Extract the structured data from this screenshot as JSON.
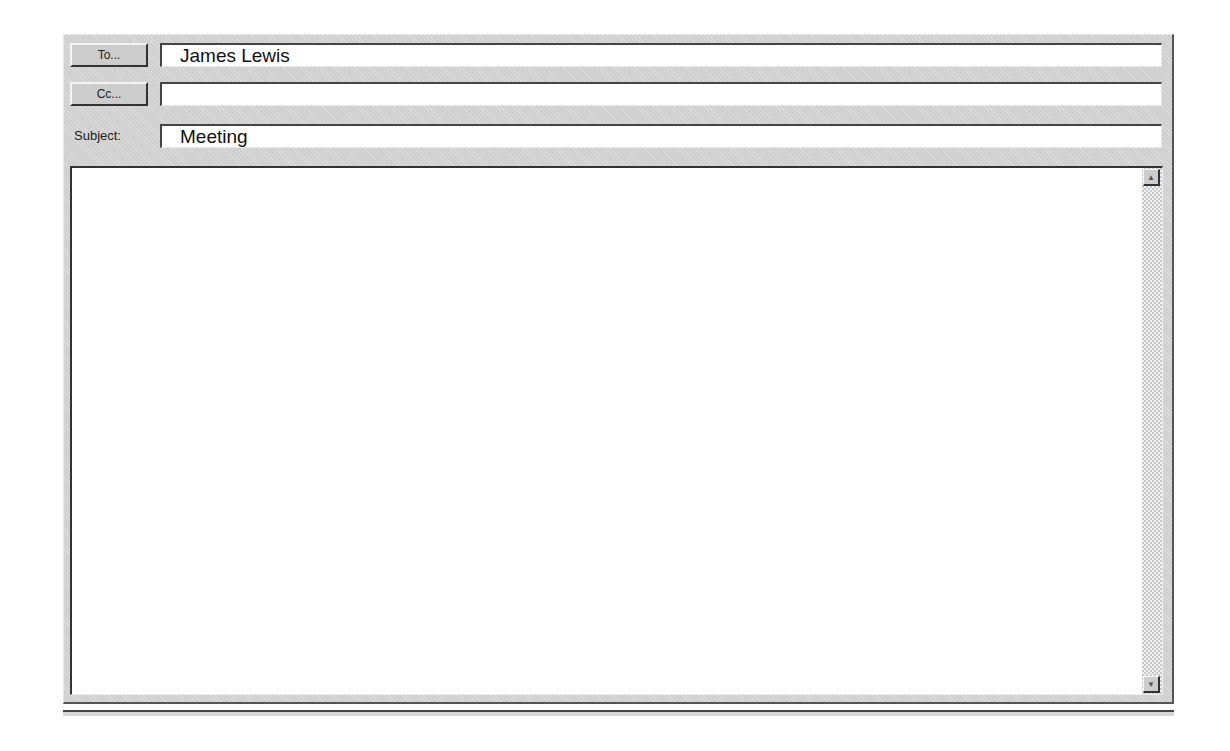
{
  "compose": {
    "to_button": {
      "label": "To...",
      "icon": "address-book"
    },
    "to_value": "James Lewis",
    "cc_button": {
      "label": "Cc...",
      "icon": "address-book"
    },
    "cc_value": "",
    "subject_label": "Subject:",
    "subject_value": "Meeting",
    "body_text": ""
  },
  "scrollbar": {
    "up_glyph": "▲",
    "down_glyph": "▼"
  }
}
